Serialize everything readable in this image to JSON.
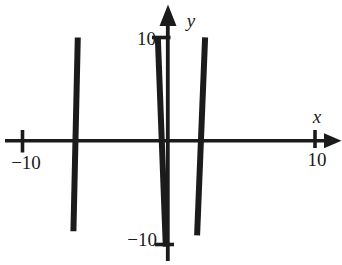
{
  "figure": {
    "background_color": "#ffffff",
    "ink_color": "#1b1b1b",
    "x_axis": {
      "label": "x",
      "neg_tick_label": "−10",
      "pos_tick_label": "10"
    },
    "y_axis": {
      "label": "y",
      "pos_tick_label": "10",
      "neg_tick_label": "−10"
    }
  },
  "chart_data": {
    "type": "line",
    "title": "",
    "xlabel": "x",
    "ylabel": "y",
    "xlim": [
      -10,
      10
    ],
    "ylim": [
      -10,
      10
    ],
    "x_ticks": [
      -10,
      10
    ],
    "y_ticks": [
      -10,
      10
    ],
    "grid": false,
    "legend": false,
    "style": "thick black near-vertical segments, scanned textbook look",
    "series": [
      {
        "name": "left steep line",
        "x": [
          -6.2,
          -6.5
        ],
        "y": [
          10.1,
          -8.8
        ]
      },
      {
        "name": "center steep line",
        "x": [
          -0.7,
          -0.15
        ],
        "y": [
          10.1,
          -10.3
        ]
      },
      {
        "name": "right steep line",
        "x": [
          2.55,
          2.0
        ],
        "y": [
          10.1,
          -9.2
        ]
      }
    ]
  }
}
